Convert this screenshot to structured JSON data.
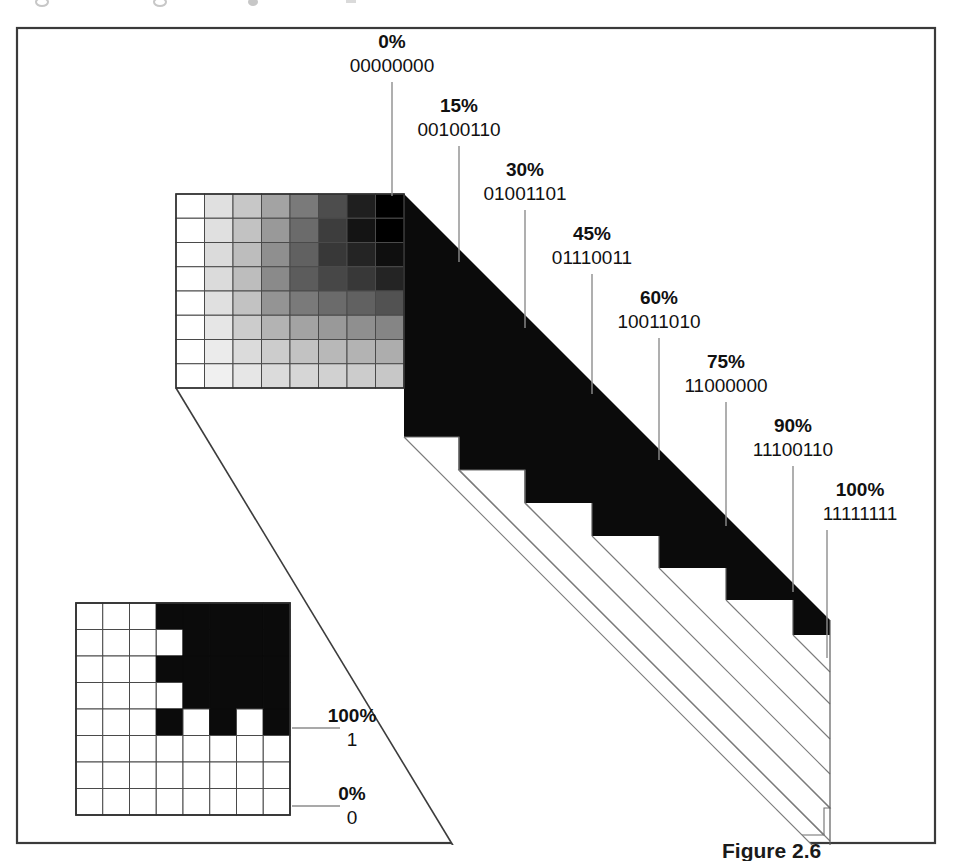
{
  "figure": {
    "caption": "Figure 2.6",
    "frame_color": "#3a3a3a",
    "background": "#ffffff",
    "slab_color": "#0b0b0b",
    "leader_color": "#8d8d8d",
    "grid_line_color": "#4a4a4a"
  },
  "callouts": [
    {
      "id": "c0",
      "percent": "0%",
      "binary": "00000000",
      "label_x": 392,
      "pct_y": 48,
      "bin_y": 72,
      "line_x": 392,
      "line_y1": 82,
      "line_y2": 196
    },
    {
      "id": "c15",
      "percent": "15%",
      "binary": "00100110",
      "label_x": 459,
      "pct_y": 112,
      "bin_y": 136,
      "line_x": 459,
      "line_y1": 146,
      "line_y2": 262
    },
    {
      "id": "c30",
      "percent": "30%",
      "binary": "01001101",
      "label_x": 525,
      "pct_y": 176,
      "bin_y": 200,
      "line_x": 525,
      "line_y1": 210,
      "line_y2": 328
    },
    {
      "id": "c45",
      "percent": "45%",
      "binary": "01110011",
      "label_x": 592,
      "pct_y": 240,
      "bin_y": 264,
      "line_x": 592,
      "line_y1": 274,
      "line_y2": 394
    },
    {
      "id": "c60",
      "percent": "60%",
      "binary": "10011010",
      "label_x": 659,
      "pct_y": 304,
      "bin_y": 328,
      "line_x": 659,
      "line_y1": 338,
      "line_y2": 460
    },
    {
      "id": "c75",
      "percent": "75%",
      "binary": "11000000",
      "label_x": 726,
      "pct_y": 368,
      "bin_y": 392,
      "line_x": 726,
      "line_y1": 402,
      "line_y2": 526
    },
    {
      "id": "c90",
      "percent": "90%",
      "binary": "11100110",
      "label_x": 793,
      "pct_y": 432,
      "bin_y": 456,
      "line_x": 793,
      "line_y1": 466,
      "line_y2": 592
    },
    {
      "id": "c100",
      "percent": "100%",
      "binary": "11111111",
      "label_x": 860,
      "pct_y": 496,
      "bin_y": 520,
      "line_x": 827,
      "line_y1": 530,
      "line_y2": 658
    }
  ],
  "inset_callouts": [
    {
      "id": "i100",
      "percent": "100%",
      "bit": "1",
      "label_x": 352,
      "pct_y": 722,
      "bit_y": 746,
      "line_x1": 292,
      "line_x2": 340,
      "line_y": 728
    },
    {
      "id": "i0",
      "percent": "0%",
      "bit": "0",
      "label_x": 352,
      "pct_y": 800,
      "bit_y": 824,
      "line_x1": 292,
      "line_x2": 340,
      "line_y": 806
    }
  ],
  "chart_data": {
    "type": "heatmap",
    "title": "Figure 2.6",
    "xlabel": "",
    "ylabel": "",
    "legend_position": "top-right diagonal callouts",
    "grid": true,
    "percent_levels": [
      0,
      15,
      30,
      45,
      60,
      75,
      90,
      100
    ],
    "binary_codes": [
      "00000000",
      "00100110",
      "01001101",
      "01110011",
      "10011010",
      "11000000",
      "11100110",
      "11111111"
    ],
    "bilevel_levels": [
      100,
      0
    ],
    "bilevel_codes": [
      "1",
      "0"
    ],
    "gray_grid": {
      "rows": 8,
      "cols": 8,
      "values": [
        [
          0,
          12,
          22,
          36,
          52,
          70,
          88,
          100
        ],
        [
          0,
          12,
          24,
          40,
          58,
          76,
          92,
          100
        ],
        [
          0,
          14,
          26,
          44,
          62,
          78,
          86,
          94
        ],
        [
          0,
          14,
          26,
          46,
          64,
          72,
          78,
          86
        ],
        [
          0,
          12,
          24,
          42,
          52,
          58,
          62,
          68
        ],
        [
          0,
          10,
          20,
          30,
          36,
          40,
          44,
          48
        ],
        [
          0,
          8,
          14,
          20,
          24,
          28,
          30,
          32
        ],
        [
          0,
          6,
          10,
          14,
          16,
          18,
          20,
          22
        ]
      ]
    },
    "bitmap_inset": {
      "rows": 8,
      "cols": 8,
      "pixels": [
        [
          0,
          0,
          0,
          1,
          1,
          1,
          1,
          1
        ],
        [
          0,
          0,
          0,
          0,
          1,
          1,
          1,
          1
        ],
        [
          0,
          0,
          0,
          1,
          1,
          1,
          1,
          1
        ],
        [
          0,
          0,
          0,
          0,
          1,
          1,
          1,
          1
        ],
        [
          0,
          0,
          0,
          1,
          0,
          1,
          0,
          1
        ],
        [
          0,
          0,
          0,
          0,
          0,
          0,
          0,
          0
        ],
        [
          0,
          0,
          0,
          0,
          0,
          0,
          0,
          0
        ],
        [
          0,
          0,
          0,
          0,
          0,
          0,
          0,
          0
        ]
      ]
    }
  },
  "geometry": {
    "frame": {
      "x": 17,
      "y": 28,
      "w": 918,
      "h": 815
    },
    "gray_grid": {
      "x": 176,
      "y": 194,
      "w": 228,
      "h": 194
    },
    "inset_grid": {
      "x": 76,
      "y": 603,
      "w": 214,
      "h": 212
    },
    "slab": {
      "top_front_x": 404,
      "top_front_y": 194,
      "dx": 139,
      "dy": 139,
      "depth_x": 426,
      "depth_y": 426,
      "step_count": 8
    }
  }
}
